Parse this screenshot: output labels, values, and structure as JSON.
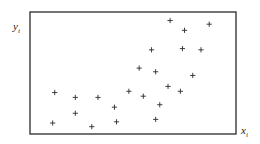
{
  "chart_data": {
    "type": "scatter",
    "title": "",
    "xlabel": "x_i",
    "ylabel": "y_i",
    "xlabel_display": {
      "base": "x",
      "sub": "i"
    },
    "ylabel_display": {
      "base": "y",
      "sub": "i"
    },
    "grid": false,
    "legend": null,
    "ticks": {
      "x": [],
      "y": []
    },
    "marker": "+",
    "frame": "full box",
    "axis_range_note": "no numeric ticks; coordinates normalized to plot frame (0-1)",
    "xlim": [
      0,
      1
    ],
    "ylim": [
      0,
      1
    ],
    "series": [
      {
        "name": "observations",
        "points": [
          {
            "x": 0.68,
            "y": 0.93
          },
          {
            "x": 0.87,
            "y": 0.9
          },
          {
            "x": 0.75,
            "y": 0.85
          },
          {
            "x": 0.59,
            "y": 0.69
          },
          {
            "x": 0.74,
            "y": 0.7
          },
          {
            "x": 0.83,
            "y": 0.69
          },
          {
            "x": 0.53,
            "y": 0.54
          },
          {
            "x": 0.61,
            "y": 0.51
          },
          {
            "x": 0.79,
            "y": 0.48
          },
          {
            "x": 0.67,
            "y": 0.39
          },
          {
            "x": 0.73,
            "y": 0.35
          },
          {
            "x": 0.55,
            "y": 0.31
          },
          {
            "x": 0.63,
            "y": 0.24
          },
          {
            "x": 0.12,
            "y": 0.34
          },
          {
            "x": 0.22,
            "y": 0.3
          },
          {
            "x": 0.33,
            "y": 0.3
          },
          {
            "x": 0.48,
            "y": 0.35
          },
          {
            "x": 0.22,
            "y": 0.17
          },
          {
            "x": 0.41,
            "y": 0.22
          },
          {
            "x": 0.11,
            "y": 0.09
          },
          {
            "x": 0.3,
            "y": 0.06
          },
          {
            "x": 0.42,
            "y": 0.1
          },
          {
            "x": 0.61,
            "y": 0.12
          }
        ]
      }
    ]
  },
  "layout": {
    "frame": {
      "left": 30,
      "top": 12,
      "right": 236,
      "bottom": 134
    },
    "colors": {
      "ink": "#2a2a2a",
      "background": "#ffffff"
    },
    "marker_half_size": 2.6
  }
}
